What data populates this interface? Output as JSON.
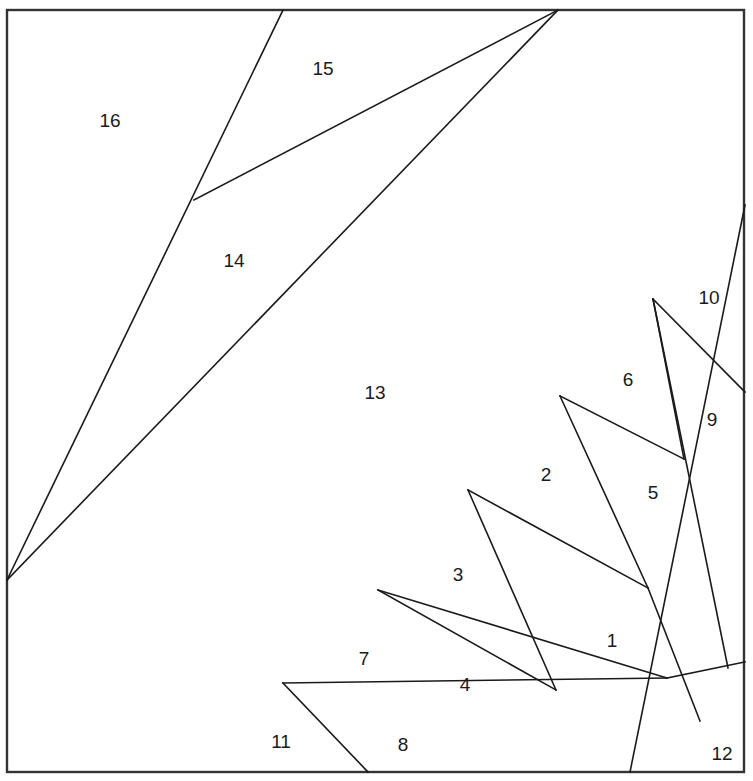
{
  "figure": {
    "type": "geometric-partition",
    "width": 753,
    "height": 781,
    "background_color": "#ffffff",
    "line_color": "#1a1a1a",
    "frame_color": "#333333",
    "label_color": "#1a1a1a",
    "frame": {
      "x": 7,
      "y": 10,
      "width": 737,
      "height": 762
    }
  },
  "regions": [
    {
      "id": "1",
      "label": "1",
      "cx": 612,
      "cy": 642
    },
    {
      "id": "2",
      "label": "2",
      "cx": 546,
      "cy": 476
    },
    {
      "id": "3",
      "label": "3",
      "cx": 458,
      "cy": 576
    },
    {
      "id": "4",
      "label": "4",
      "cx": 465,
      "cy": 686
    },
    {
      "id": "5",
      "label": "5",
      "cx": 653,
      "cy": 494
    },
    {
      "id": "6",
      "label": "6",
      "cx": 628,
      "cy": 381
    },
    {
      "id": "7",
      "label": "7",
      "cx": 364,
      "cy": 660
    },
    {
      "id": "8",
      "label": "8",
      "cx": 403,
      "cy": 746
    },
    {
      "id": "9",
      "label": "9",
      "cx": 712,
      "cy": 421
    },
    {
      "id": "10",
      "label": "10",
      "cx": 709,
      "cy": 299
    },
    {
      "id": "11",
      "label": "11",
      "cx": 281,
      "cy": 743
    },
    {
      "id": "12",
      "label": "12",
      "cx": 722,
      "cy": 755
    },
    {
      "id": "13",
      "label": "13",
      "cx": 375,
      "cy": 394
    },
    {
      "id": "14",
      "label": "14",
      "cx": 234,
      "cy": 262
    },
    {
      "id": "15",
      "label": "15",
      "cx": 323,
      "cy": 70
    },
    {
      "id": "16",
      "label": "16",
      "cx": 110,
      "cy": 122
    }
  ],
  "segments": [
    {
      "name": "main-diagonal",
      "x1": 745,
      "y1": 205,
      "x2": 630,
      "y2": 772
    },
    {
      "name": "ray-topleft-upper",
      "x1": 7,
      "y1": 580,
      "x2": 283,
      "y2": 10
    },
    {
      "name": "ray-topleft-lower",
      "x1": 7,
      "y1": 580,
      "x2": 558,
      "y2": 10
    },
    {
      "name": "chord-15-14",
      "x1": 194,
      "y1": 200,
      "x2": 558,
      "y2": 10
    },
    {
      "name": "fan-10-9",
      "x1": 653,
      "y1": 299,
      "x2": 745,
      "y2": 392
    },
    {
      "name": "fan-6-5",
      "x1": 653,
      "y1": 299,
      "x2": 684,
      "y2": 459
    },
    {
      "name": "fan-9-boundary",
      "x1": 653,
      "y1": 299,
      "x2": 728,
      "y2": 668
    },
    {
      "name": "chord-6-2",
      "x1": 560,
      "y1": 396,
      "x2": 684,
      "y2": 459
    },
    {
      "name": "fan-2-5",
      "x1": 560,
      "y1": 396,
      "x2": 648,
      "y2": 588
    },
    {
      "name": "fan-5-1",
      "x1": 648,
      "y1": 588,
      "x2": 700,
      "y2": 721
    },
    {
      "name": "chord-2-3",
      "x1": 468,
      "y1": 490,
      "x2": 648,
      "y2": 588
    },
    {
      "name": "fan-3-4",
      "x1": 468,
      "y1": 490,
      "x2": 556,
      "y2": 690
    },
    {
      "name": "chord-3-7",
      "x1": 378,
      "y1": 590,
      "x2": 667,
      "y2": 678
    },
    {
      "name": "fan-7-4",
      "x1": 378,
      "y1": 590,
      "x2": 556,
      "y2": 690
    },
    {
      "name": "chord-7-11",
      "x1": 283,
      "y1": 683,
      "x2": 667,
      "y2": 678
    },
    {
      "name": "fan-11-8",
      "x1": 283,
      "y1": 683,
      "x2": 368,
      "y2": 772
    },
    {
      "name": "edge-12-corner",
      "x1": 667,
      "y1": 678,
      "x2": 745,
      "y2": 662
    }
  ]
}
